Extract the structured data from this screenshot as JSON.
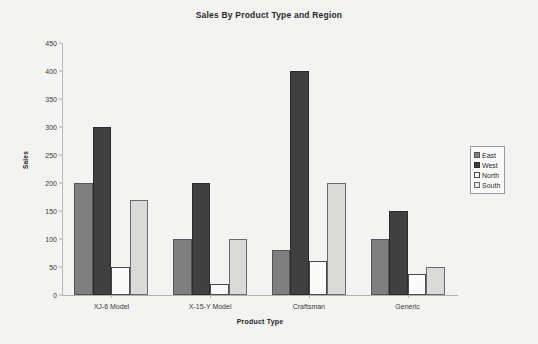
{
  "chart_data": {
    "type": "bar",
    "title": "Sales By Product Type and Region",
    "xlabel": "Product Type",
    "ylabel": "Sales",
    "categories": [
      "XJ-6 Model",
      "X-15-Y Model",
      "Craftsman",
      "Generic"
    ],
    "series": [
      {
        "name": "East",
        "values": [
          200,
          100,
          80,
          100
        ],
        "color": "#7f7f7f"
      },
      {
        "name": "West",
        "values": [
          300,
          200,
          400,
          150
        ],
        "color": "#404040"
      },
      {
        "name": "North",
        "values": [
          50,
          20,
          60,
          38
        ],
        "color": "#ffffff"
      },
      {
        "name": "South",
        "values": [
          170,
          100,
          200,
          50
        ],
        "color": "#dadad8"
      }
    ],
    "ylim": [
      0,
      450
    ],
    "yticks": [
      0,
      50,
      100,
      150,
      200,
      250,
      300,
      350,
      400,
      450
    ],
    "ytick_labels": [
      "0",
      "50",
      "100",
      "150",
      "200",
      "250",
      "300",
      "350",
      "400",
      "450"
    ],
    "grid": false,
    "legend_position": "right"
  },
  "legend": {
    "entries": [
      "East",
      "West",
      "North",
      "South"
    ]
  }
}
